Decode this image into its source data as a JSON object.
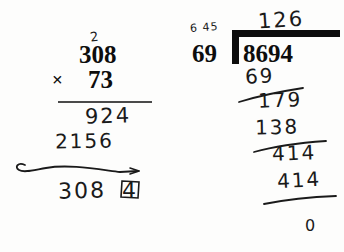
{
  "page": {
    "kind": "handwritten-arithmetic-worksheet",
    "background_color": "#fdfdfc",
    "ink_color": "#1a1a1a"
  },
  "multiplication": {
    "carry_mark": "2",
    "multiplicand": "308",
    "operator": "×",
    "multiplier": "73",
    "partial_product_1": "924",
    "partial_product_2": "2156",
    "product": "308",
    "product_corrected_digit": "4",
    "product_full": "3084"
  },
  "division": {
    "margin_note": "6 45",
    "quotient": "126",
    "divisor": "69",
    "dividend": "8694",
    "step_subtract_1": "69",
    "step_remainder_1": "179",
    "step_subtract_2": "138",
    "step_remainder_2": "414",
    "step_subtract_3": "414",
    "final_remainder": "0"
  }
}
